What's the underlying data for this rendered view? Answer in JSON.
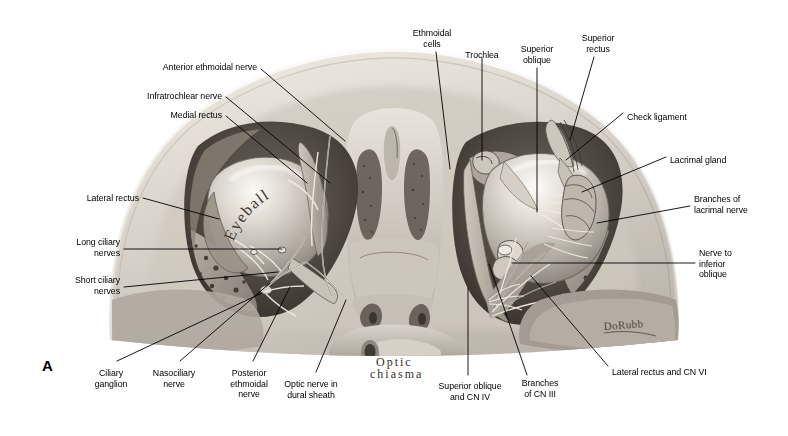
{
  "figure": {
    "panel_letter": "A",
    "background_color": "#ffffff",
    "ink_color": "#000000",
    "title_hidden": "Superior view of the orbits: nerves and extraocular muscles"
  },
  "in_figure_annotations": [
    {
      "id": "eyeball",
      "text": "Eyeball",
      "style": "handwritten-curved"
    },
    {
      "id": "optic-chiasma",
      "text": "Optic\nchiasma",
      "style": "handwritten"
    },
    {
      "id": "artist-signature",
      "text": "DoRubb",
      "style": "signature"
    }
  ],
  "labels": [
    {
      "id": "anterior-ethmoidal-nerve",
      "text": "Anterior ethmoidal nerve",
      "align": "right",
      "x": 257,
      "y": 62,
      "leader": [
        [
          261,
          69
        ],
        [
          345,
          141
        ]
      ]
    },
    {
      "id": "infratrochlear-nerve",
      "text": "Infratrochlear nerve",
      "align": "right",
      "x": 222,
      "y": 91,
      "leader": [
        [
          226,
          97
        ],
        [
          330,
          183
        ]
      ]
    },
    {
      "id": "medial-rectus",
      "text": "Medial rectus",
      "align": "right",
      "x": 222,
      "y": 110,
      "leader": [
        [
          226,
          116
        ],
        [
          307,
          183
        ]
      ]
    },
    {
      "id": "lateral-rectus",
      "text": "Lateral rectus",
      "align": "right",
      "x": 139,
      "y": 193,
      "leader": [
        [
          143,
          198
        ],
        [
          219,
          219
        ]
      ]
    },
    {
      "id": "long-ciliary-nerves",
      "text": "Long ciliary\nnerves",
      "align": "right",
      "x": 120,
      "y": 237,
      "leader": [
        [
          124,
          249
        ],
        [
          282,
          249
        ]
      ]
    },
    {
      "id": "short-ciliary-nerves",
      "text": "Short ciliary\nnerves",
      "align": "right",
      "x": 120,
      "y": 275,
      "leader": [
        [
          124,
          287
        ],
        [
          278,
          272
        ]
      ]
    },
    {
      "id": "ethmoidal-cells",
      "text": "Ethmoidal\ncells",
      "align": "center",
      "x": 432,
      "y": 28,
      "leader": [
        [
          436,
          52
        ],
        [
          450,
          169
        ]
      ]
    },
    {
      "id": "trochlea",
      "text": "Trochlea",
      "align": "center",
      "x": 482,
      "y": 50,
      "leader": [
        [
          482,
          58
        ],
        [
          482,
          160
        ]
      ]
    },
    {
      "id": "superior-oblique",
      "text": "Superior\noblique",
      "align": "center",
      "x": 537,
      "y": 44,
      "leader": [
        [
          537,
          68
        ],
        [
          537,
          212
        ]
      ]
    },
    {
      "id": "superior-rectus",
      "text": "Superior\nrectus",
      "align": "center",
      "x": 598,
      "y": 33,
      "leader": [
        [
          594,
          57
        ],
        [
          570,
          140
        ]
      ]
    },
    {
      "id": "check-ligament",
      "text": "Check ligament",
      "align": "left",
      "x": 627,
      "y": 112,
      "leader": [
        [
          623,
          113
        ],
        [
          566,
          160
        ]
      ]
    },
    {
      "id": "lacrimal-gland",
      "text": "Lacrimal gland",
      "align": "left",
      "x": 670,
      "y": 155,
      "leader": [
        [
          666,
          157
        ],
        [
          582,
          192
        ]
      ]
    },
    {
      "id": "branches-of-lacrimal-nerve",
      "text": "Branches of\nlacrimal nerve",
      "align": "left",
      "x": 694,
      "y": 194,
      "leader": [
        [
          690,
          206
        ],
        [
          597,
          223
        ]
      ]
    },
    {
      "id": "nerve-to-inferior-oblique",
      "text": "Nerve to\ninferior\noblique",
      "align": "left",
      "x": 699,
      "y": 248,
      "leader": [
        [
          695,
          263
        ],
        [
          512,
          263
        ]
      ]
    },
    {
      "id": "lateral-rectus-and-cn-vi",
      "text": "Lateral rectus and CN VI",
      "align": "left",
      "x": 612,
      "y": 367,
      "leader": [
        [
          608,
          366
        ],
        [
          531,
          276
        ]
      ]
    },
    {
      "id": "branches-of-cn-iii",
      "text": "Branches\nof CN III",
      "align": "center",
      "x": 540,
      "y": 378,
      "leader": [
        [
          527,
          375
        ],
        [
          489,
          264
        ]
      ]
    },
    {
      "id": "superior-oblique-and-cn-iv",
      "text": "Superior oblique\nand CN IV",
      "align": "center",
      "x": 470,
      "y": 381,
      "leader": [
        [
          468,
          375
        ],
        [
          468,
          288
        ]
      ]
    },
    {
      "id": "optic-nerve-in-dural-sheath",
      "text": "Optic nerve in\ndural sheath",
      "align": "center",
      "x": 311,
      "y": 379,
      "leader": [
        [
          316,
          372
        ],
        [
          346,
          300
        ]
      ]
    },
    {
      "id": "posterior-ethmoidal-nerve",
      "text": "Posterior\nethmoidal\nnerve",
      "align": "center",
      "x": 249,
      "y": 368,
      "leader": [
        [
          253,
          361
        ],
        [
          290,
          287
        ]
      ]
    },
    {
      "id": "nasociliary-nerve",
      "text": "Nasociliary\nnerve",
      "align": "center",
      "x": 174,
      "y": 368,
      "leader": [
        [
          180,
          361
        ],
        [
          270,
          283
        ]
      ]
    },
    {
      "id": "ciliary-ganglion",
      "text": "Ciliary\nganglion",
      "align": "center",
      "x": 111,
      "y": 368,
      "leader": [
        [
          117,
          361
        ],
        [
          262,
          293
        ]
      ]
    }
  ]
}
